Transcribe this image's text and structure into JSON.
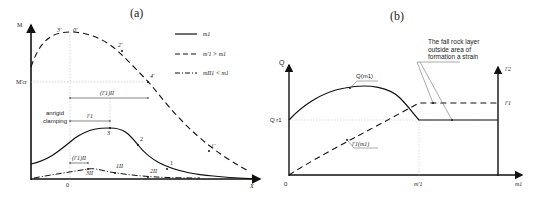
{
  "panel_a": {
    "title": "(a)",
    "y_axis_label": "M",
    "x_axis_label": "X",
    "origin_label": "0",
    "m_threshold_label": "M'cr",
    "note": "anrigid clamping",
    "dims": {
      "d_top": "(l'1)II",
      "d_mid": "l'1",
      "d_low": "(l'1)II"
    },
    "points": {
      "p3prime": "3'",
      "p0prime": "0'",
      "p2prime": "2'",
      "p4prime": "4'",
      "p1prime": "1'",
      "p3": "3",
      "p2": "2",
      "p1": "1",
      "p3dbl": "3II",
      "p1dbl": "1II",
      "p2dbl": "2II"
    },
    "legend": [
      {
        "style": "solid",
        "label": "m1"
      },
      {
        "style": "dashed",
        "label": "m'1 > m1"
      },
      {
        "style": "dashdot",
        "label": "mII1 < m1"
      }
    ]
  },
  "panel_b": {
    "title": "(b)",
    "y_axis_label": "Q",
    "x_axis_label": "m1",
    "origin_label": "0",
    "q_threshold_label": "Q r1",
    "x_mark_label": "m'1",
    "right_axis_top": "l'2",
    "right_axis_mid": "l'1",
    "curve_q_label": "Q(m1)",
    "curve_l_label": "l'1(m1)",
    "note": [
      "The fall rock layer",
      "outside area of",
      "formation a strain"
    ]
  }
}
